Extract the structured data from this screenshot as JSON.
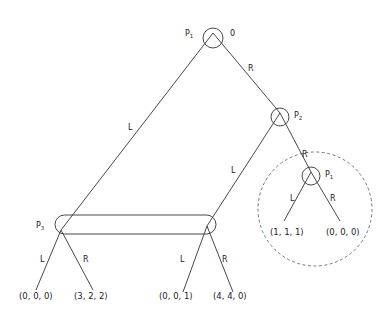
{
  "diagram": {
    "type": "extensive-form game tree",
    "nodes": {
      "root": {
        "player": "P",
        "sub": "1",
        "annotation": "0"
      },
      "p2": {
        "player": "P",
        "sub": "2"
      },
      "p1_inner": {
        "player": "P",
        "sub": "1"
      },
      "p3": {
        "player": "P",
        "sub": "3"
      }
    },
    "edges": {
      "root_left": "L",
      "root_right": "R",
      "p2_left": "L",
      "p2_right": "R",
      "p1_left": "L",
      "p1_right": "R",
      "p3a_left": "L",
      "p3a_right": "R",
      "p3b_left": "L",
      "p3b_right": "R"
    },
    "payoffs": {
      "p3a_L": "(0, 0, 0)",
      "p3a_R": "(3, 2, 2)",
      "p3b_L": "(0, 0, 1)",
      "p3b_R": "(4, 4, 0)",
      "p1_L": "(1, 1, 1)",
      "p1_R": "(0, 0, 0)"
    },
    "information_set": "P3 nodes connected (rounded rectangle)",
    "subgame_marker": "dashed circle around P1 subgame"
  }
}
